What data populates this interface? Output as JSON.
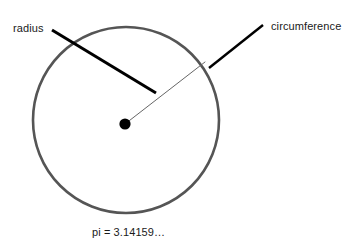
{
  "diagram": {
    "type": "circle-geometry-diagram",
    "background_color": "#ffffff",
    "labels": {
      "radius": "radius",
      "circumference": "circumference",
      "pi": "pi = 3.14159…"
    },
    "colors": {
      "circle_stroke": "#555555",
      "radius_line": "#666666",
      "leader_line": "#000000",
      "center_dot": "#000000",
      "text": "#1a1a1a"
    },
    "geometry": {
      "circle": {
        "cx": 126,
        "cy": 120,
        "r": 93,
        "stroke_width": 2.6
      },
      "center_dot": {
        "cx": 125,
        "cy": 124,
        "r": 5.6
      },
      "radius_line": {
        "x1": 125,
        "y1": 124,
        "x2": 205,
        "y2": 62,
        "stroke_width": 1
      },
      "radius_leader": {
        "x1": 52,
        "y1": 30,
        "x2": 156,
        "y2": 93,
        "stroke_width": 3
      },
      "circumference_leader": {
        "x1": 263,
        "y1": 25,
        "x2": 209,
        "y2": 68,
        "stroke_width": 2.4
      }
    }
  }
}
